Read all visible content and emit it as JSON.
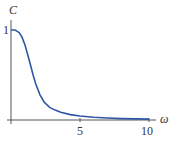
{
  "chart_data": {
    "type": "line",
    "title": "",
    "xlabel": "ω",
    "ylabel": "C",
    "x_ticks": [
      "5",
      "10"
    ],
    "y_ticks": [
      "1"
    ],
    "xlim": [
      0,
      10
    ],
    "ylim": [
      0,
      1.1
    ],
    "grid": false,
    "series": [
      {
        "name": "C(ω)",
        "color": "#2f55a4",
        "x": [
          0,
          0.3,
          0.6,
          0.8,
          1.0,
          1.2,
          1.4,
          1.6,
          1.8,
          2.1,
          2.4,
          2.8,
          3.2,
          3.6,
          4.3,
          5,
          6,
          7,
          8,
          9,
          10
        ],
        "y": [
          1.0,
          1.0,
          0.97,
          0.92,
          0.84,
          0.73,
          0.62,
          0.5,
          0.4,
          0.28,
          0.2,
          0.14,
          0.11,
          0.085,
          0.06,
          0.045,
          0.03,
          0.022,
          0.016,
          0.012,
          0.01
        ]
      }
    ]
  }
}
